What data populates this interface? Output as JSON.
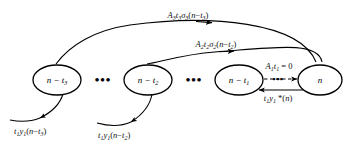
{
  "diagram": {
    "background_color": "#ffffff",
    "stroke_color": "#000000",
    "nodes": [
      {
        "id": "n-t3",
        "label": "n − t",
        "sub": "3",
        "cx": 57,
        "cy": 80
      },
      {
        "id": "n-t2",
        "label": "n − t",
        "sub": "2",
        "cx": 148,
        "cy": 80
      },
      {
        "id": "n-t1",
        "label": "n − t",
        "sub": "1",
        "cx": 239,
        "cy": 80
      },
      {
        "id": "n",
        "label": "n",
        "sub": "",
        "cx": 320,
        "cy": 80
      }
    ],
    "ellipsis": [
      {
        "id": "ellipsis-left",
        "text": "•••",
        "x": 103,
        "y": 84
      },
      {
        "id": "ellipsis-middle",
        "text": "•••",
        "x": 194,
        "y": 84
      },
      {
        "id": "ellipsis-dashed",
        "text": "•••",
        "x": 281,
        "y": 80
      }
    ],
    "edge_labels": {
      "arc_top": {
        "id": "arc-top-label",
        "parts": [
          {
            "t": "A",
            "sub": "3"
          },
          {
            "t": "t",
            "sub": "3"
          },
          {
            "t": "σ",
            "sub": "3"
          },
          {
            "t": "(n − t",
            "sub": "3"
          },
          {
            "t": ")",
            "sub": ""
          }
        ],
        "plain": "A3t3σ3(n−t3)",
        "x": 188,
        "y": 18
      },
      "arc_mid": {
        "id": "arc-mid-label",
        "parts": [
          {
            "t": "A",
            "sub": "2"
          },
          {
            "t": "t",
            "sub": "2"
          },
          {
            "t": "σ",
            "sub": "2"
          },
          {
            "t": "(n − t",
            "sub": "2"
          },
          {
            "t": ")",
            "sub": ""
          }
        ],
        "plain": "A2t2σ2(n−t2)",
        "x": 216,
        "y": 47
      },
      "dashed_top": {
        "id": "dashed-edge-label",
        "parts": [
          {
            "t": "A",
            "sub": "1"
          },
          {
            "t": "t",
            "sub": "1"
          },
          {
            "t": " = 0",
            "sub": ""
          }
        ],
        "plain": "A1t1 = 0",
        "x": 279,
        "y": 69
      },
      "return_bottom": {
        "id": "return-edge-label",
        "parts": [
          {
            "t": "t",
            "sub": "1"
          },
          {
            "t": "y",
            "sub": "1"
          },
          {
            "t": " *(n)",
            "sub": ""
          }
        ],
        "plain": "t1y1 *(n)",
        "x": 278,
        "y": 100
      },
      "down_left_3": {
        "id": "output-label-t3",
        "parts": [
          {
            "t": "t",
            "sub": "1"
          },
          {
            "t": "y",
            "sub": "1"
          },
          {
            "t": "(n − t",
            "sub": "3"
          },
          {
            "t": ")",
            "sub": ""
          }
        ],
        "plain": "t1y1(n−t3)",
        "x": 14,
        "y": 133
      },
      "down_left_2": {
        "id": "output-label-t2",
        "parts": [
          {
            "t": "t",
            "sub": "1"
          },
          {
            "t": "y",
            "sub": "1"
          },
          {
            "t": "(n − t",
            "sub": "2"
          },
          {
            "t": ")",
            "sub": ""
          }
        ],
        "plain": "t1y1(n−t2)",
        "x": 98,
        "y": 137
      }
    },
    "edges": [
      {
        "id": "arc-n-to-nt3",
        "style": "solid",
        "direction": "right-arrow"
      },
      {
        "id": "arc-n-to-nt2",
        "style": "solid",
        "direction": "right-arrow"
      },
      {
        "id": "edge-nt1-to-n-dashed",
        "style": "dashed",
        "direction": "right-arrow"
      },
      {
        "id": "edge-n-to-nt1-return",
        "style": "solid",
        "direction": "left-arrow"
      },
      {
        "id": "edge-nt3-output",
        "style": "solid",
        "direction": "down-left-arrow"
      },
      {
        "id": "edge-nt2-output",
        "style": "solid",
        "direction": "down-left-arrow"
      }
    ]
  }
}
